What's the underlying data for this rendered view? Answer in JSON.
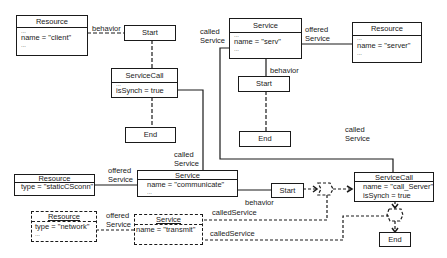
{
  "diagram": {
    "nodes": {
      "resource_client": {
        "title": "Resource",
        "ellipsis_top": "...",
        "attr": "name = \"client\"",
        "ellipsis_bottom": "..."
      },
      "start_top": {
        "title": "Start"
      },
      "servicecall_top": {
        "title": "ServiceCall",
        "ellipsis_top": "...",
        "attr": "isSynch = true"
      },
      "end_top": {
        "title": "End"
      },
      "service_serv": {
        "title": "Service",
        "ellipsis_top": "...",
        "attr": "name = \"serv\"",
        "ellipsis_bottom": "..."
      },
      "resource_server": {
        "title": "Resource",
        "ellipsis_top": "...",
        "attr": "name = \"server\"",
        "ellipsis_bottom": "..."
      },
      "start_serv": {
        "title": "Start"
      },
      "end_serv": {
        "title": "End"
      },
      "resource_static": {
        "title": "Resource",
        "attr": "type = \"staticCSconn\"",
        "ellipsis_bottom": "..."
      },
      "service_communicate": {
        "title": "Service",
        "attr": "name = \"communicate\"",
        "ellipsis_bottom": "..."
      },
      "start_communicate": {
        "title": "Start"
      },
      "servicecall_server": {
        "title": "ServiceCall",
        "attr1": "name = \"call_Server\"",
        "attr2": "isSynch = true"
      },
      "end_bottom": {
        "title": "End"
      },
      "resource_network": {
        "title": "Resource",
        "attr": "type = \"network\"",
        "ellipsis_bottom": "..."
      },
      "service_transmit": {
        "title": "Service",
        "attr": "name = \"transmit\""
      }
    },
    "labels": {
      "behavior_client": "behavior",
      "called_service_top_1": "called",
      "called_service_top_2": "Service",
      "offered_service_serv_1": "offered",
      "offered_service_serv_2": "Service",
      "behavior_serv": "behavior",
      "called_service_mid_1": "called",
      "called_service_mid_2": "Service",
      "called_service_right_1": "called",
      "called_service_right_2": "Service",
      "offered_service_static_1": "offered",
      "offered_service_static_2": "Service",
      "behavior_communicate": "behavior",
      "offered_service_network_1": "offered",
      "offered_service_network_2": "Service",
      "called_service_dashed_1": "calledService",
      "called_service_dashed_2": "calledService"
    }
  }
}
